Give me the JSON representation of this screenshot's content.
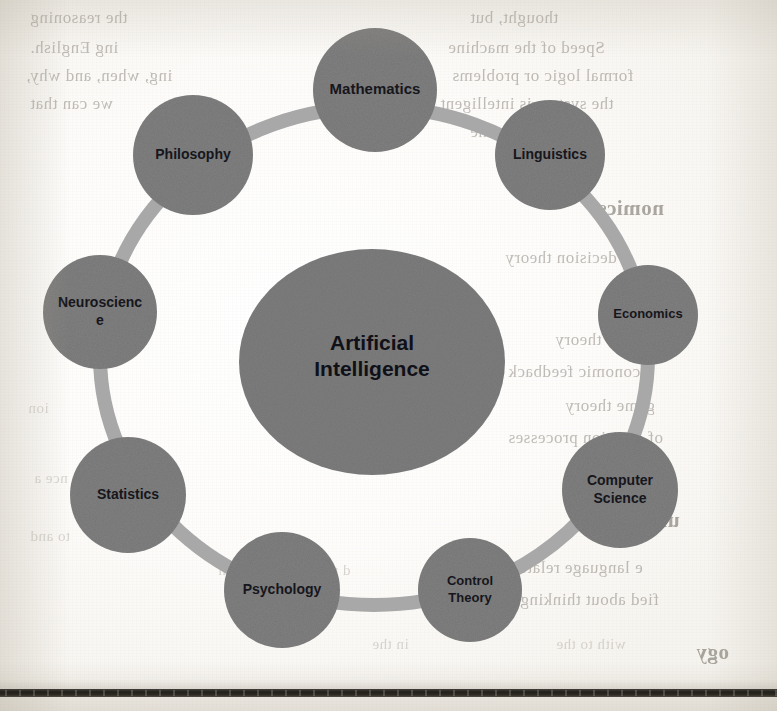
{
  "page": {
    "kind": "scanned-book-page",
    "background_color": "#fbfaf7",
    "width": 777,
    "height": 711
  },
  "diagram": {
    "type": "hub-and-spoke-ring",
    "colors": {
      "node_fill": "#7f7f7f",
      "ring_stroke": "#a8a8a8",
      "hub_fill": "#7d7d7d",
      "label_color": "#16161c"
    },
    "hub": {
      "label_line1": "Artificial",
      "label_line2": "Intelligence",
      "cx": 372,
      "cy": 362,
      "rx": 133,
      "ry": 113
    },
    "ring": {
      "cx": 374,
      "cy": 356,
      "rx": 274,
      "ry": 249,
      "stroke_width": 14
    },
    "nodes": [
      {
        "id": "mathematics",
        "label": "Mathematics",
        "lines": [
          "Mathematics"
        ],
        "cx": 375,
        "cy": 90,
        "r": 62,
        "font_size": 15
      },
      {
        "id": "linguistics",
        "label": "Linguistics",
        "lines": [
          "Linguistics"
        ],
        "cx": 550,
        "cy": 155,
        "r": 55,
        "font_size": 14
      },
      {
        "id": "economics",
        "label": "Economics",
        "lines": [
          "Economics"
        ],
        "cx": 648,
        "cy": 315,
        "r": 50,
        "font_size": 13
      },
      {
        "id": "computer-science",
        "label": "Computer Science",
        "lines": [
          "Computer",
          "Science"
        ],
        "cx": 620,
        "cy": 490,
        "r": 58,
        "font_size": 14
      },
      {
        "id": "control-theory",
        "label": "Control Theory",
        "lines": [
          "Control",
          "Theory"
        ],
        "cx": 470,
        "cy": 590,
        "r": 52,
        "font_size": 13
      },
      {
        "id": "psychology",
        "label": "Psychology",
        "lines": [
          "Psychology"
        ],
        "cx": 282,
        "cy": 590,
        "r": 58,
        "font_size": 14
      },
      {
        "id": "statistics",
        "label": "Statistics",
        "lines": [
          "Statistics"
        ],
        "cx": 128,
        "cy": 495,
        "r": 58,
        "font_size": 14
      },
      {
        "id": "neuroscience",
        "label": "Neuroscience",
        "lines": [
          "Neuroscienc",
          "e"
        ],
        "cx": 100,
        "cy": 312,
        "r": 57,
        "font_size": 14
      },
      {
        "id": "philosophy",
        "label": "Philosophy",
        "lines": [
          "Philosophy"
        ],
        "cx": 193,
        "cy": 155,
        "r": 60,
        "font_size": 14
      }
    ]
  },
  "bleed_through": {
    "note": "faint mirrored text showing through from the reverse side of the scanned page",
    "fragments": [
      {
        "text": "the reasoning",
        "x": 30,
        "y": 8,
        "style": "b-body"
      },
      {
        "text": "ing English.",
        "x": 30,
        "y": 38,
        "style": "b-body"
      },
      {
        "text": "ing, when, and why,",
        "x": 26,
        "y": 66,
        "style": "b-body"
      },
      {
        "text": "we can that",
        "x": 30,
        "y": 94,
        "style": "b-body"
      },
      {
        "text": "thought, but",
        "x": 470,
        "y": 8,
        "style": "b-body"
      },
      {
        "text": "Speed of the machine",
        "x": 448,
        "y": 38,
        "style": "b-body"
      },
      {
        "text": "formal logic or problems",
        "x": 452,
        "y": 66,
        "style": "b-body"
      },
      {
        "text": "the system is intelligent",
        "x": 440,
        "y": 94,
        "style": "b-body"
      },
      {
        "text": "certain the",
        "x": 470,
        "y": 122,
        "style": "b-body"
      },
      {
        "text": "nomics",
        "x": 598,
        "y": 196,
        "style": "b-head"
      },
      {
        "text": "decision theory",
        "x": 505,
        "y": 248,
        "style": "b-body"
      },
      {
        "text": "s Can",
        "x": 632,
        "y": 294,
        "style": "b-body"
      },
      {
        "text": "utility theory",
        "x": 555,
        "y": 330,
        "style": "b-body"
      },
      {
        "text": "economic feedback",
        "x": 508,
        "y": 362,
        "style": "b-body"
      },
      {
        "text": "game theory",
        "x": 565,
        "y": 396,
        "style": "b-body"
      },
      {
        "text": "of decision processes",
        "x": 508,
        "y": 428,
        "style": "b-body"
      },
      {
        "text": "uistics",
        "x": 620,
        "y": 508,
        "style": "b-head"
      },
      {
        "text": "e language relate to",
        "x": 500,
        "y": 558,
        "style": "b-body"
      },
      {
        "text": "fied about thinking",
        "x": 520,
        "y": 590,
        "style": "b-body"
      },
      {
        "text": "ogy",
        "x": 696,
        "y": 640,
        "style": "b-head"
      },
      {
        "text": "ion",
        "x": 28,
        "y": 400,
        "style": "b-small b-faint"
      },
      {
        "text": "nce a",
        "x": 34,
        "y": 470,
        "style": "b-small b-faint"
      },
      {
        "text": "to and",
        "x": 30,
        "y": 528,
        "style": "b-small b-faint"
      },
      {
        "text": "d up and a cognition",
        "x": 218,
        "y": 562,
        "style": "b-small b-faint"
      },
      {
        "text": "in the",
        "x": 372,
        "y": 636,
        "style": "b-small b-faint"
      },
      {
        "text": "with to the",
        "x": 556,
        "y": 636,
        "style": "b-small b-faint"
      }
    ]
  }
}
